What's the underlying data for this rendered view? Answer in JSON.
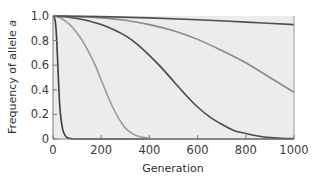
{
  "chart_data": {
    "type": "line",
    "title": "",
    "xlabel": "Generation",
    "ylabel": "Frequency of allele a",
    "ylabel_prefix": "Frequency of allele ",
    "ylabel_italic": "a",
    "xlim": [
      0,
      1000
    ],
    "ylim": [
      0,
      1.0
    ],
    "x_ticks": [
      0,
      200,
      400,
      600,
      800,
      1000
    ],
    "x_tick_labels": [
      "0",
      "200",
      "400",
      "600",
      "800",
      "1000"
    ],
    "y_ticks": [
      0,
      0.2,
      0.4,
      0.6,
      0.8,
      1.0
    ],
    "y_tick_labels": [
      "0",
      "0.2",
      "0.4",
      "0.6",
      "0.8",
      "1.0"
    ],
    "grid": false,
    "legend": null,
    "plot_background": "#ececec",
    "series": [
      {
        "name": "curve-1",
        "color": "#3d3d3d",
        "x": [
          0,
          5,
          10,
          15,
          20,
          25,
          30,
          40,
          50,
          60,
          75,
          100,
          200,
          1000
        ],
        "y": [
          1.0,
          0.99,
          0.95,
          0.82,
          0.6,
          0.38,
          0.22,
          0.08,
          0.03,
          0.01,
          0.003,
          0.0,
          0.0,
          0.0
        ]
      },
      {
        "name": "curve-2",
        "color": "#9a9a9a",
        "x": [
          0,
          25,
          50,
          75,
          100,
          125,
          150,
          175,
          200,
          225,
          250,
          275,
          300,
          325,
          350,
          400,
          450,
          1000
        ],
        "y": [
          1.0,
          0.99,
          0.96,
          0.92,
          0.86,
          0.79,
          0.7,
          0.6,
          0.48,
          0.36,
          0.25,
          0.16,
          0.09,
          0.05,
          0.025,
          0.006,
          0.0,
          0.0
        ]
      },
      {
        "name": "curve-3",
        "color": "#4a4a4a",
        "x": [
          0,
          50,
          100,
          150,
          200,
          250,
          300,
          350,
          400,
          450,
          500,
          550,
          600,
          650,
          700,
          750,
          800,
          850,
          900,
          950,
          1000
        ],
        "y": [
          1.0,
          0.995,
          0.98,
          0.96,
          0.93,
          0.89,
          0.84,
          0.77,
          0.68,
          0.58,
          0.47,
          0.36,
          0.26,
          0.18,
          0.12,
          0.07,
          0.045,
          0.025,
          0.012,
          0.006,
          0.003
        ]
      },
      {
        "name": "curve-4",
        "color": "#8a8a8a",
        "x": [
          0,
          100,
          200,
          300,
          400,
          500,
          600,
          700,
          800,
          900,
          1000
        ],
        "y": [
          1.0,
          0.995,
          0.985,
          0.965,
          0.93,
          0.88,
          0.81,
          0.72,
          0.62,
          0.5,
          0.38
        ]
      },
      {
        "name": "curve-5",
        "color": "#4f4f4f",
        "x": [
          0,
          200,
          400,
          600,
          800,
          1000
        ],
        "y": [
          1.0,
          0.995,
          0.985,
          0.97,
          0.95,
          0.93
        ]
      }
    ]
  }
}
